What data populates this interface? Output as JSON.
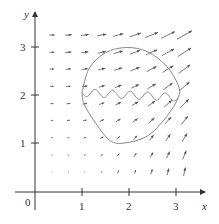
{
  "figure": {
    "axes": {
      "x_label": "x",
      "y_label": "y",
      "origin_label": "0",
      "x_ticks": [
        {
          "value": 1,
          "label": "1"
        },
        {
          "value": 2,
          "label": "2"
        },
        {
          "value": 3,
          "label": "3"
        }
      ],
      "y_ticks": [
        {
          "value": 1,
          "label": "1"
        },
        {
          "value": 2,
          "label": "2"
        },
        {
          "value": 3,
          "label": "3"
        }
      ],
      "x_range": [
        -0.1,
        3.6
      ],
      "y_range": [
        -0.4,
        3.7
      ]
    },
    "vector_field": {
      "grid_x": [
        0.36,
        0.71,
        1.06,
        1.42,
        1.77,
        2.13,
        2.48,
        2.83,
        3.18
      ],
      "grid_y": [
        0.4,
        0.75,
        1.11,
        1.47,
        1.82,
        2.18,
        2.54,
        2.89,
        3.25
      ],
      "arrow_color": "#555555"
    },
    "closed_curve": {
      "color": "#888888",
      "points": [
        [
          1.0,
          2.05
        ],
        [
          1.15,
          2.55
        ],
        [
          1.5,
          2.88
        ],
        [
          1.95,
          2.99
        ],
        [
          2.4,
          2.9
        ],
        [
          2.8,
          2.6
        ],
        [
          3.05,
          2.2
        ],
        [
          3.05,
          1.95
        ],
        [
          2.8,
          1.55
        ],
        [
          2.4,
          1.15
        ],
        [
          1.9,
          1.0
        ],
        [
          1.6,
          1.05
        ],
        [
          1.3,
          1.4
        ],
        [
          1.05,
          1.8
        ],
        [
          1.0,
          2.05
        ]
      ]
    },
    "wavy_path": {
      "color": "#888888",
      "start": [
        1.0,
        2.05
      ],
      "end": [
        3.05,
        1.95
      ],
      "periods": 5.5,
      "amplitude": 0.08
    }
  }
}
